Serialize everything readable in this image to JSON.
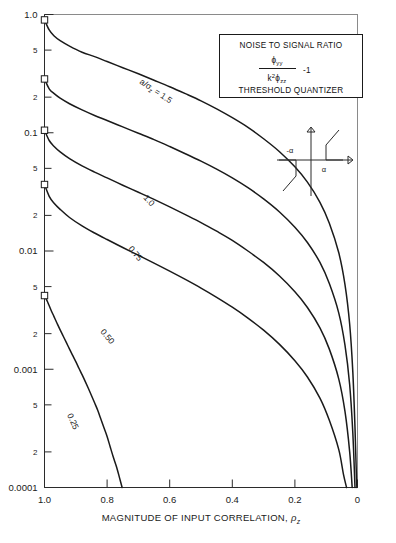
{
  "figure": {
    "title_box": {
      "line1": "NOISE TO SIGNAL RATIO",
      "numerator": "ϕ",
      "numerator_sub": "yy",
      "denominator_k": "k",
      "denominator_k_sup": "2",
      "denominator_phi": "ϕ",
      "denominator_sub": "zz",
      "minus_one": "-1",
      "line4": "THRESHOLD QUANTIZER"
    },
    "inset": {
      "name": "threshold-quantizer-characteristic",
      "label_neg": "-α",
      "label_pos": "α"
    },
    "xaxis": {
      "title_main": "MAGNITUDE OF INPUT CORRELATION,",
      "title_symbol": "ρ",
      "title_symbol_sub": "z",
      "ticks": [
        "1.0",
        "0.8",
        "0.6",
        "0.4",
        "0.2",
        "0"
      ],
      "tick_values": [
        1.0,
        0.8,
        0.6,
        0.4,
        0.2,
        0.0
      ],
      "range": [
        1.0,
        0.0
      ],
      "reversed": true
    },
    "yaxis": {
      "major_ticks": [
        "1.0",
        "0.1",
        "0.01",
        "0.001",
        "0.0001"
      ],
      "major_values": [
        1,
        0.1,
        0.01,
        0.001,
        0.0001
      ],
      "minor_ticks": [
        "5",
        "2"
      ],
      "scale": "log",
      "range": [
        0.0001,
        1.0
      ]
    },
    "curve_labels": [
      "a/σ",
      "z",
      " = 1.5",
      "1.0",
      "0.75",
      "0.50",
      "0.25"
    ]
  },
  "chart_data": {
    "type": "line",
    "title": "NOISE TO SIGNAL RATIO",
    "subtitle": "THRESHOLD QUANTIZER",
    "xlabel": "MAGNITUDE OF INPUT CORRELATION, ρz",
    "ylabel": "ϕyy / (k² ϕzz) - 1",
    "xlim": [
      1.0,
      0.0
    ],
    "ylim": [
      0.0001,
      1.0
    ],
    "yscale": "log",
    "xscale": "linear",
    "x_reversed": true,
    "grid": false,
    "legend": "inline-curve-labels",
    "series": [
      {
        "name": "a/σz = 1.5",
        "label": "a/σz = 1.5",
        "start_marker": true,
        "points": [
          [
            1.0,
            0.9
          ],
          [
            0.985,
            0.74
          ],
          [
            0.97,
            0.66
          ],
          [
            0.95,
            0.6
          ],
          [
            0.92,
            0.54
          ],
          [
            0.88,
            0.48
          ],
          [
            0.84,
            0.44
          ],
          [
            0.8,
            0.4
          ],
          [
            0.75,
            0.355
          ],
          [
            0.7,
            0.315
          ],
          [
            0.65,
            0.278
          ],
          [
            0.6,
            0.245
          ],
          [
            0.55,
            0.214
          ],
          [
            0.5,
            0.186
          ],
          [
            0.45,
            0.159
          ],
          [
            0.4,
            0.134
          ],
          [
            0.35,
            0.111
          ],
          [
            0.3,
            0.089
          ],
          [
            0.25,
            0.0695
          ],
          [
            0.2,
            0.0515
          ],
          [
            0.16,
            0.0382
          ],
          [
            0.12,
            0.0258
          ],
          [
            0.09,
            0.0172
          ],
          [
            0.06,
            0.0097
          ],
          [
            0.04,
            0.0052
          ],
          [
            0.025,
            0.0024
          ],
          [
            0.015,
            0.00095
          ],
          [
            0.008,
            0.00032
          ],
          [
            0.004,
            0.00014
          ],
          [
            0.002,
            0.0001
          ]
        ]
      },
      {
        "name": "a/σz = 1.0",
        "label": "1.0",
        "start_marker": true,
        "points": [
          [
            1.0,
            0.285
          ],
          [
            0.985,
            0.235
          ],
          [
            0.97,
            0.215
          ],
          [
            0.95,
            0.196
          ],
          [
            0.92,
            0.176
          ],
          [
            0.88,
            0.156
          ],
          [
            0.84,
            0.14
          ],
          [
            0.8,
            0.127
          ],
          [
            0.75,
            0.112
          ],
          [
            0.7,
            0.099
          ],
          [
            0.65,
            0.0875
          ],
          [
            0.6,
            0.0765
          ],
          [
            0.55,
            0.0665
          ],
          [
            0.5,
            0.0575
          ],
          [
            0.45,
            0.0492
          ],
          [
            0.4,
            0.0415
          ],
          [
            0.35,
            0.0343
          ],
          [
            0.3,
            0.0276
          ],
          [
            0.25,
            0.0215
          ],
          [
            0.2,
            0.0159
          ],
          [
            0.16,
            0.0118
          ],
          [
            0.12,
            0.008
          ],
          [
            0.09,
            0.0053
          ],
          [
            0.06,
            0.003
          ],
          [
            0.04,
            0.0016
          ],
          [
            0.025,
            0.00074
          ],
          [
            0.015,
            0.00029
          ],
          [
            0.008,
            0.0001
          ]
        ]
      },
      {
        "name": "a/σz = 0.75",
        "label": "0.75",
        "start_marker": true,
        "points": [
          [
            1.0,
            0.105
          ],
          [
            0.985,
            0.086
          ],
          [
            0.97,
            0.077
          ],
          [
            0.95,
            0.069
          ],
          [
            0.92,
            0.0605
          ],
          [
            0.88,
            0.0525
          ],
          [
            0.84,
            0.0465
          ],
          [
            0.8,
            0.0415
          ],
          [
            0.75,
            0.036
          ],
          [
            0.7,
            0.0314
          ],
          [
            0.65,
            0.0273
          ],
          [
            0.6,
            0.0236
          ],
          [
            0.55,
            0.0203
          ],
          [
            0.5,
            0.0174
          ],
          [
            0.45,
            0.0147
          ],
          [
            0.4,
            0.0123
          ],
          [
            0.35,
            0.01
          ],
          [
            0.3,
            0.008
          ],
          [
            0.25,
            0.00617
          ],
          [
            0.2,
            0.00452
          ],
          [
            0.16,
            0.00333
          ],
          [
            0.12,
            0.00224
          ],
          [
            0.09,
            0.00148
          ],
          [
            0.06,
            0.00083
          ],
          [
            0.04,
            0.00044
          ],
          [
            0.025,
            0.0002
          ],
          [
            0.017,
            0.0001
          ]
        ]
      },
      {
        "name": "a/σz = 0.50",
        "label": "0.50",
        "start_marker": true,
        "points": [
          [
            1.0,
            0.0365
          ],
          [
            0.985,
            0.029
          ],
          [
            0.97,
            0.0255
          ],
          [
            0.95,
            0.0225
          ],
          [
            0.92,
            0.0192
          ],
          [
            0.88,
            0.0163
          ],
          [
            0.84,
            0.0142
          ],
          [
            0.8,
            0.0125
          ],
          [
            0.75,
            0.0107
          ],
          [
            0.7,
            0.0092
          ],
          [
            0.65,
            0.0079
          ],
          [
            0.6,
            0.00676
          ],
          [
            0.55,
            0.00575
          ],
          [
            0.5,
            0.00486
          ],
          [
            0.45,
            0.00406
          ],
          [
            0.4,
            0.00335
          ],
          [
            0.35,
            0.00271
          ],
          [
            0.3,
            0.00214
          ],
          [
            0.25,
            0.00163
          ],
          [
            0.2,
            0.00118
          ],
          [
            0.16,
            0.00086
          ],
          [
            0.12,
            0.00057
          ],
          [
            0.09,
            0.00037
          ],
          [
            0.06,
            0.00021
          ],
          [
            0.045,
            0.00013
          ],
          [
            0.035,
            0.0001
          ]
        ]
      },
      {
        "name": "a/σz = 0.25",
        "label": "0.25",
        "start_marker": true,
        "points": [
          [
            1.0,
            0.0042
          ],
          [
            0.99,
            0.0037
          ],
          [
            0.98,
            0.0032
          ],
          [
            0.97,
            0.0028
          ],
          [
            0.96,
            0.00245
          ],
          [
            0.95,
            0.00215
          ],
          [
            0.94,
            0.0019
          ],
          [
            0.93,
            0.00168
          ],
          [
            0.92,
            0.00148
          ],
          [
            0.91,
            0.00131
          ],
          [
            0.9,
            0.00116
          ],
          [
            0.89,
            0.00102
          ],
          [
            0.88,
            0.0009
          ],
          [
            0.87,
            0.00079
          ],
          [
            0.86,
            0.00069
          ],
          [
            0.85,
            0.0006
          ],
          [
            0.84,
            0.00052
          ],
          [
            0.83,
            0.00045
          ],
          [
            0.82,
            0.00038
          ],
          [
            0.81,
            0.00032
          ],
          [
            0.8,
            0.00027
          ],
          [
            0.79,
            0.00022
          ],
          [
            0.78,
            0.00018
          ],
          [
            0.77,
            0.00015
          ],
          [
            0.76,
            0.00012
          ],
          [
            0.752,
            0.0001
          ]
        ]
      }
    ]
  }
}
